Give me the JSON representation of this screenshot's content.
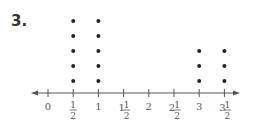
{
  "problem": {
    "number": "3."
  },
  "chart_data": {
    "type": "dot_plot",
    "title": "",
    "xlabel": "",
    "ylabel": "",
    "categories": [
      "0",
      "1/2",
      "1",
      "1 1/2",
      "2",
      "2 1/2",
      "3",
      "3 1/2"
    ],
    "x": [
      0,
      0.5,
      1,
      1.5,
      2,
      2.5,
      3,
      3.5
    ],
    "values": [
      0,
      5,
      5,
      0,
      0,
      0,
      3,
      3
    ],
    "xlim": [
      0,
      3.5
    ],
    "grid": false,
    "arrows_both_ends": true
  },
  "axis": {
    "ticks": [
      {
        "whole": "0",
        "num": "",
        "den": ""
      },
      {
        "whole": "",
        "num": "1",
        "den": "2"
      },
      {
        "whole": "1",
        "num": "",
        "den": ""
      },
      {
        "whole": "1",
        "num": "1",
        "den": "2"
      },
      {
        "whole": "2",
        "num": "",
        "den": ""
      },
      {
        "whole": "2",
        "num": "1",
        "den": "2"
      },
      {
        "whole": "3",
        "num": "",
        "den": ""
      },
      {
        "whole": "3",
        "num": "1",
        "den": "2"
      }
    ]
  },
  "colors": {
    "axis": "#555555",
    "dot": "#222222",
    "text": "#555555"
  }
}
